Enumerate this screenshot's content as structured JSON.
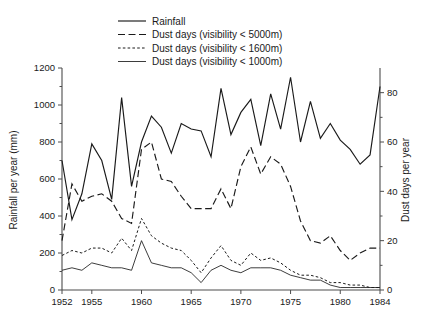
{
  "chart_data": {
    "type": "line",
    "title": "",
    "xlabel": "",
    "ylabel": "Rainfall per year (mm)",
    "y2label": "Dust days per year",
    "xlim": [
      1952,
      1984
    ],
    "ylim": [
      0,
      1200
    ],
    "y2lim": [
      0,
      90
    ],
    "grid": false,
    "legend_position": "top-left",
    "x_ticks": [
      1952,
      1955,
      1960,
      1965,
      1970,
      1975,
      1980,
      1984
    ],
    "x_tick_labels": [
      "1952",
      "1955",
      "1960",
      "1965",
      "1970",
      "1975",
      "1980",
      "1984"
    ],
    "y_ticks": [
      0,
      200,
      400,
      600,
      800,
      1000,
      1200
    ],
    "y_tick_labels": [
      "0",
      "200",
      "400",
      "600",
      "800",
      "1000",
      "1200"
    ],
    "y2_ticks": [
      0,
      20,
      40,
      60,
      80
    ],
    "y2_tick_labels": [
      "0",
      "20",
      "40",
      "60",
      "80"
    ],
    "x": [
      1952,
      1953,
      1954,
      1955,
      1956,
      1957,
      1958,
      1959,
      1960,
      1961,
      1962,
      1963,
      1964,
      1965,
      1966,
      1967,
      1968,
      1969,
      1970,
      1971,
      1972,
      1973,
      1974,
      1975,
      1976,
      1977,
      1978,
      1979,
      1980,
      1981,
      1982,
      1983,
      1984
    ],
    "series": [
      {
        "name": "Rainfall",
        "axis": "left",
        "units": "mm",
        "style": "solid",
        "values": [
          700,
          380,
          520,
          790,
          700,
          490,
          1040,
          560,
          800,
          940,
          880,
          740,
          900,
          870,
          860,
          720,
          1090,
          840,
          960,
          1030,
          780,
          1060,
          870,
          1150,
          800,
          1020,
          820,
          900,
          810,
          760,
          680,
          730,
          1100
        ]
      },
      {
        "name": "Dust days (visibility < 5000m)",
        "axis": "right",
        "units": "days",
        "style": "dashed",
        "values": [
          20,
          43,
          36,
          38,
          39,
          36,
          29,
          27,
          57,
          60,
          45,
          44,
          38,
          33,
          33,
          33,
          41,
          33,
          50,
          58,
          47,
          54,
          51,
          42,
          28,
          20,
          19,
          22,
          16,
          12,
          15,
          17,
          17
        ]
      },
      {
        "name": "Dust days (visibility < 1600m)",
        "axis": "right",
        "units": "days",
        "style": "dotted",
        "values": [
          14,
          16,
          15,
          17,
          17,
          15,
          21,
          16,
          29,
          22,
          19,
          17,
          16,
          12,
          7,
          13,
          18,
          12,
          10,
          15,
          12,
          13,
          11,
          8,
          6,
          6,
          5,
          3,
          3,
          2,
          2,
          1,
          1
        ]
      },
      {
        "name": "Dust days (visibility < 1000m)",
        "axis": "right",
        "units": "days",
        "style": "thin-solid",
        "values": [
          8,
          9,
          8,
          11,
          10,
          9,
          9,
          8,
          20,
          11,
          10,
          9,
          9,
          7,
          3,
          8,
          10,
          8,
          7,
          9,
          9,
          9,
          8,
          6,
          5,
          4,
          4,
          2,
          1,
          1,
          1,
          1,
          1
        ]
      }
    ],
    "legend": [
      {
        "label": "Rainfall",
        "style": "solid"
      },
      {
        "label": "Dust days (visibility < 5000m)",
        "style": "dashed"
      },
      {
        "label": "Dust days (visibility < 1600m)",
        "style": "dotted"
      },
      {
        "label": "Dust days (visibility < 1000m)",
        "style": "thin-solid"
      }
    ],
    "colors": {
      "line": "#1a1a1a",
      "axis": "#4c4c4c",
      "background": "#ffffff"
    }
  }
}
